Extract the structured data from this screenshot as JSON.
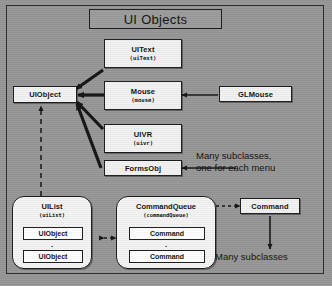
{
  "diagram": {
    "title": "UI Objects",
    "background_color": "#969696",
    "node_fill": "#f2f2f2",
    "line_color": "#1c1c1c"
  },
  "nodes": {
    "uiobject": {
      "cls": "UIObject",
      "inst": ""
    },
    "uitext": {
      "cls": "UIText",
      "inst": "(uiText)"
    },
    "mouse": {
      "cls": "Mouse",
      "inst": "(mouse)"
    },
    "glmouse": {
      "cls": "GLMouse",
      "inst": ""
    },
    "uivr": {
      "cls": "UIVR",
      "inst": "(uivr)"
    },
    "formsobj": {
      "cls": "FormsObj",
      "inst": ""
    },
    "uilist": {
      "cls": "UIList",
      "inst": "(uiList)"
    },
    "commandqueue": {
      "cls": "CommandQueue",
      "inst": "(commandQueue)"
    },
    "command": {
      "cls": "Command",
      "inst": ""
    }
  },
  "slots": {
    "uilist_items": [
      "UIObject",
      "UIObject"
    ],
    "commandqueue_items": [
      "Command",
      "Command"
    ],
    "ellipsis": "."
  },
  "notes": {
    "menus": "Many subclasses,\none for each menu",
    "commands": "Many subclasses"
  }
}
